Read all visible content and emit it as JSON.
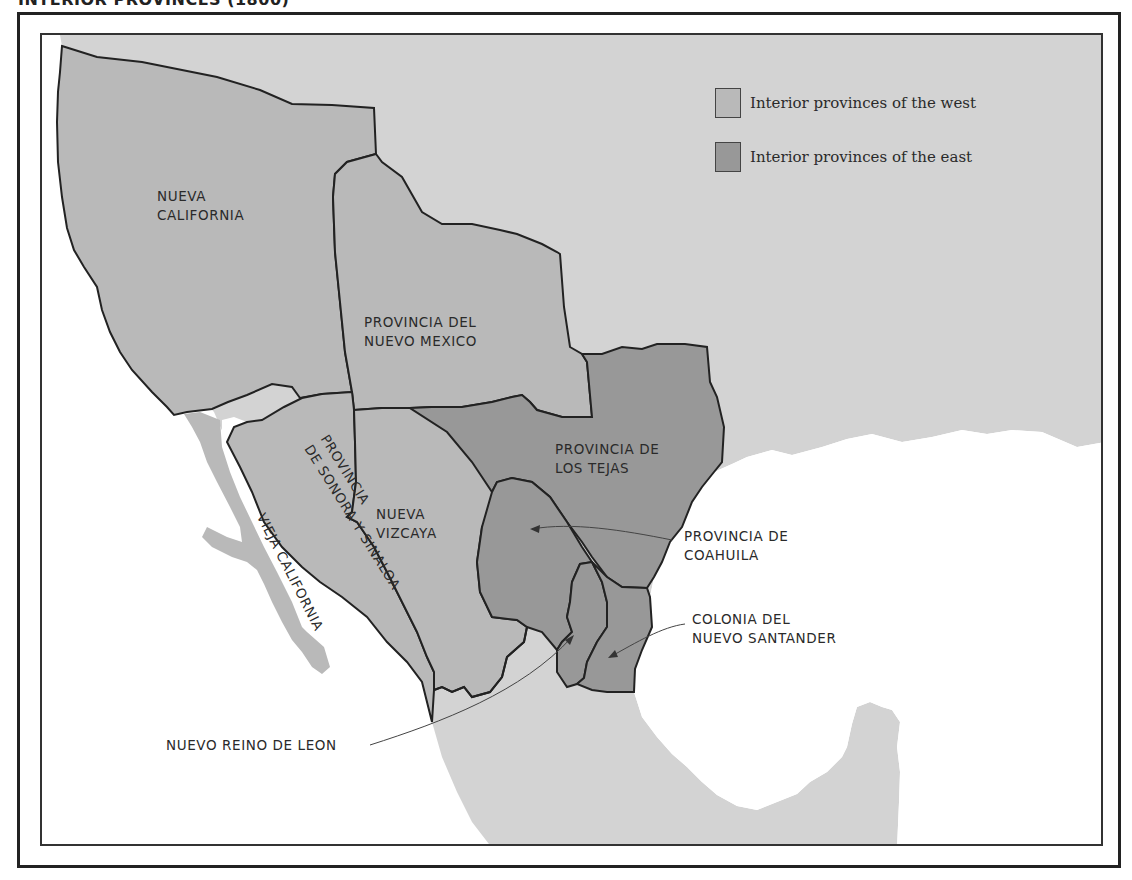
{
  "title": "INTERIOR PROVINCES (1800)",
  "colors": {
    "background_land": "#d3d3d3",
    "west_provinces": "#b9b9b9",
    "east_provinces": "#989898",
    "water": "#ffffff",
    "border": "#222222"
  },
  "legend": {
    "items": [
      {
        "label": "Interior provinces of the west",
        "color": "#b9b9b9"
      },
      {
        "label": "Interior provinces of the east",
        "color": "#989898"
      }
    ]
  },
  "regions": {
    "nueva_california": {
      "label": "NUEVA\nCALIFORNIA",
      "group": "west"
    },
    "nuevo_mexico": {
      "label": "PROVINCIA DEL\nNUEVO MEXICO",
      "group": "west"
    },
    "sonora_sinaloa": {
      "label": "PROVINCIA\nDE SONORA Y SINALOA",
      "group": "west"
    },
    "vieja_california": {
      "label": "VIEJA CALIFORNIA",
      "group": "west"
    },
    "nueva_vizcaya": {
      "label": "NUEVA\nVIZCAYA",
      "group": "west"
    },
    "los_tejas": {
      "label": "PROVINCIA DE\nLOS TEJAS",
      "group": "east"
    },
    "coahuila": {
      "label": "PROVINCIA DE\nCOAHUILA",
      "group": "east"
    },
    "nuevo_santander": {
      "label": "COLONIA DEL\nNUEVO SANTANDER",
      "group": "east"
    },
    "nuevo_leon": {
      "label": "NUEVO REINO DE LEON",
      "group": "east"
    }
  }
}
